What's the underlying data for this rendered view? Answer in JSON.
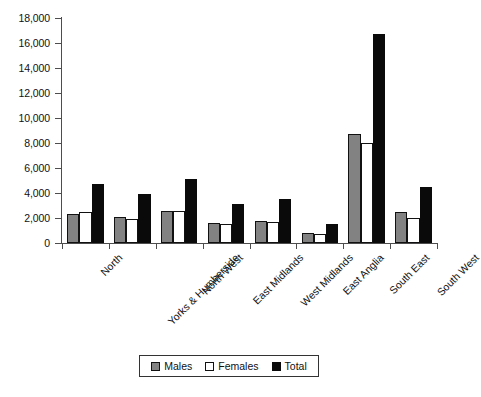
{
  "chart_data": {
    "type": "bar",
    "title": "",
    "subtitle": "",
    "xlabel": "",
    "ylabel": "",
    "ylim": [
      0,
      18000
    ],
    "ytick_labels": [
      "0",
      "2,000",
      "4,000",
      "6,000",
      "8,000",
      "10,000",
      "12,000",
      "14,000",
      "16,000",
      "18,000"
    ],
    "ytick_values": [
      0,
      2000,
      4000,
      6000,
      8000,
      10000,
      12000,
      14000,
      16000,
      18000
    ],
    "grid": false,
    "legend_position": "bottom-center",
    "categories": [
      "North",
      "Yorks & Humberside",
      "North West",
      "East Midlands",
      "West Midlands",
      "East Anglia",
      "South East",
      "South West"
    ],
    "series": [
      {
        "name": "Males",
        "color": "#828282",
        "values": [
          2300,
          2050,
          2600,
          1600,
          1800,
          800,
          8700,
          2500
        ]
      },
      {
        "name": "Females",
        "color": "#ffffff",
        "values": [
          2450,
          1900,
          2550,
          1500,
          1700,
          750,
          8000,
          2000
        ]
      },
      {
        "name": "Total",
        "color": "#0a0a0a",
        "values": [
          4750,
          3950,
          5150,
          3100,
          3500,
          1550,
          16700,
          4450
        ]
      }
    ]
  },
  "legend": {
    "items": [
      {
        "label": "Males",
        "swatch": "males"
      },
      {
        "label": "Females",
        "swatch": "females"
      },
      {
        "label": "Total",
        "swatch": "total"
      }
    ]
  }
}
